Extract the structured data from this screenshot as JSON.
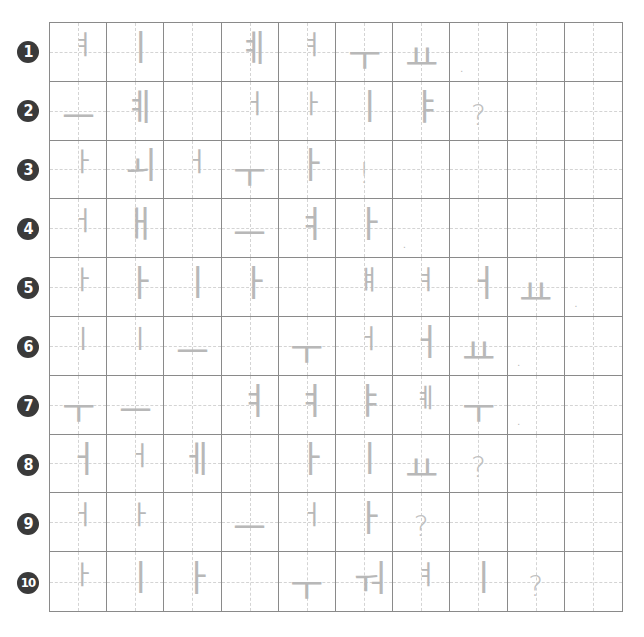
{
  "worksheet": {
    "type": "hangul-vowel-tracing-grid",
    "colors": {
      "grid_line": "#8a8a8a",
      "guide_line": "#d4d4d4",
      "glyph": "#b8b8b8",
      "badge_bg": "#3a3a3a",
      "badge_text": "#ffffff"
    },
    "rows": [
      {
        "number": "1",
        "cells": [
          {
            "g": "ㅕ",
            "k": "v sm"
          },
          {
            "g": "ㅣ",
            "k": "v"
          },
          {
            "g": "",
            "k": ""
          },
          {
            "g": "ㅖ",
            "k": "v"
          },
          {
            "g": "ㅕ",
            "k": "v sm"
          },
          {
            "g": "ㅜ",
            "k": "h"
          },
          {
            "g": "ㅛ",
            "k": "h"
          },
          {
            "g": ".",
            "k": "d"
          },
          {
            "g": "",
            "k": ""
          },
          {
            "g": "",
            "k": ""
          }
        ]
      },
      {
        "number": "2",
        "cells": [
          {
            "g": "ㅡ",
            "k": "h"
          },
          {
            "g": "ㅖ",
            "k": "v"
          },
          {
            "g": "",
            "k": ""
          },
          {
            "g": "ㅓ",
            "k": "v sm"
          },
          {
            "g": "ㅏ",
            "k": "v sm"
          },
          {
            "g": "ㅣ",
            "k": "v"
          },
          {
            "g": "ㅑ",
            "k": "v"
          },
          {
            "g": "?",
            "k": "p"
          },
          {
            "g": "",
            "k": ""
          },
          {
            "g": "",
            "k": ""
          }
        ]
      },
      {
        "number": "3",
        "cells": [
          {
            "g": "ㅏ",
            "k": "v sm"
          },
          {
            "g": "ㅚ",
            "k": "v"
          },
          {
            "g": "ㅓ",
            "k": "v sm"
          },
          {
            "g": "ㅜ",
            "k": "h"
          },
          {
            "g": "ㅏ",
            "k": "v"
          },
          {
            "g": "!",
            "k": "p"
          },
          {
            "g": "",
            "k": ""
          },
          {
            "g": "",
            "k": ""
          },
          {
            "g": "",
            "k": ""
          },
          {
            "g": "",
            "k": ""
          }
        ]
      },
      {
        "number": "4",
        "cells": [
          {
            "g": "ㅓ",
            "k": "v sm"
          },
          {
            "g": "ㅐ",
            "k": "v"
          },
          {
            "g": "",
            "k": ""
          },
          {
            "g": "ㅡ",
            "k": "h"
          },
          {
            "g": "ㅕ",
            "k": "v"
          },
          {
            "g": "ㅏ",
            "k": "v"
          },
          {
            "g": ".",
            "k": "d"
          },
          {
            "g": "",
            "k": ""
          },
          {
            "g": "",
            "k": ""
          },
          {
            "g": "",
            "k": ""
          }
        ]
      },
      {
        "number": "5",
        "cells": [
          {
            "g": "ㅏ",
            "k": "v sm"
          },
          {
            "g": "ㅏ",
            "k": "v"
          },
          {
            "g": "ㅣ",
            "k": "v"
          },
          {
            "g": "ㅏ",
            "k": "v"
          },
          {
            "g": "",
            "k": ""
          },
          {
            "g": "ㅒ",
            "k": "v sm"
          },
          {
            "g": "ㅕ",
            "k": "v sm"
          },
          {
            "g": "ㅓ",
            "k": "v"
          },
          {
            "g": "ㅛ",
            "k": "h"
          },
          {
            "g": ".",
            "k": "d"
          }
        ]
      },
      {
        "number": "6",
        "cells": [
          {
            "g": "ㅣ",
            "k": "v sm"
          },
          {
            "g": "ㅣ",
            "k": "v sm"
          },
          {
            "g": "ㅡ",
            "k": "h"
          },
          {
            "g": "",
            "k": ""
          },
          {
            "g": "ㅜ",
            "k": "h"
          },
          {
            "g": "ㅓ",
            "k": "v sm"
          },
          {
            "g": "ㅓ",
            "k": "v"
          },
          {
            "g": "ㅛ",
            "k": "h"
          },
          {
            "g": ".",
            "k": "d"
          },
          {
            "g": "",
            "k": ""
          }
        ]
      },
      {
        "number": "7",
        "cells": [
          {
            "g": "ㅜ",
            "k": "h"
          },
          {
            "g": "ㅡ",
            "k": "h"
          },
          {
            "g": "",
            "k": ""
          },
          {
            "g": "ㅕ",
            "k": "v"
          },
          {
            "g": "ㅕ",
            "k": "v"
          },
          {
            "g": "ㅑ",
            "k": "v"
          },
          {
            "g": "ㅖ",
            "k": "v sm"
          },
          {
            "g": "ㅜ",
            "k": "h"
          },
          {
            "g": ".",
            "k": "d"
          },
          {
            "g": "",
            "k": ""
          }
        ]
      },
      {
        "number": "8",
        "cells": [
          {
            "g": "ㅓ",
            "k": "v"
          },
          {
            "g": "ㅓ",
            "k": "v sm"
          },
          {
            "g": "ㅔ",
            "k": "v"
          },
          {
            "g": "",
            "k": ""
          },
          {
            "g": "ㅏ",
            "k": "v"
          },
          {
            "g": "ㅣ",
            "k": "v"
          },
          {
            "g": "ㅛ",
            "k": "h"
          },
          {
            "g": "?",
            "k": "p"
          },
          {
            "g": "",
            "k": ""
          },
          {
            "g": "",
            "k": ""
          }
        ]
      },
      {
        "number": "9",
        "cells": [
          {
            "g": "ㅓ",
            "k": "v sm"
          },
          {
            "g": "ㅏ",
            "k": "v sm"
          },
          {
            "g": "",
            "k": ""
          },
          {
            "g": "ㅡ",
            "k": "h"
          },
          {
            "g": "ㅓ",
            "k": "v sm"
          },
          {
            "g": "ㅏ",
            "k": "v"
          },
          {
            "g": "?",
            "k": "p"
          },
          {
            "g": "",
            "k": ""
          },
          {
            "g": "",
            "k": ""
          },
          {
            "g": "",
            "k": ""
          }
        ]
      },
      {
        "number": "10",
        "cells": [
          {
            "g": "ㅏ",
            "k": "v sm"
          },
          {
            "g": "ㅣ",
            "k": "v"
          },
          {
            "g": "ㅏ",
            "k": "v"
          },
          {
            "g": "",
            "k": ""
          },
          {
            "g": "ㅜ",
            "k": "h"
          },
          {
            "g": "ㅝ",
            "k": "v"
          },
          {
            "g": "ㅕ",
            "k": "v sm"
          },
          {
            "g": "ㅣ",
            "k": "v"
          },
          {
            "g": "?",
            "k": "p"
          },
          {
            "g": "",
            "k": ""
          }
        ]
      }
    ]
  }
}
